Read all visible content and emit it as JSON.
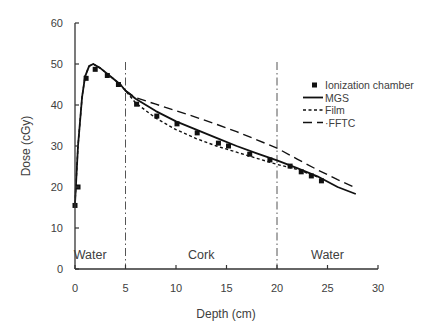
{
  "chart_data": {
    "type": "line",
    "title": "",
    "xlabel": "Depth (cm)",
    "ylabel": "Dose (cGy)",
    "xlim": [
      0,
      30
    ],
    "ylim": [
      0,
      60
    ],
    "xticks": [
      0,
      5,
      10,
      15,
      20,
      25,
      30
    ],
    "yticks": [
      0,
      10,
      20,
      30,
      40,
      50,
      60
    ],
    "grid": false,
    "legend_position": "right-center",
    "region_boundaries": [
      5,
      20
    ],
    "region_labels": [
      {
        "text": "Water",
        "x": 1.5
      },
      {
        "text": "Cork",
        "x": 12.5
      },
      {
        "text": "Water",
        "x": 25
      }
    ],
    "series": [
      {
        "name": "Ionization chamber",
        "style": "markers",
        "marker": "square",
        "x": [
          0,
          0.3,
          1.1,
          2.0,
          3.2,
          4.3,
          6.1,
          8.1,
          10.1,
          12.1,
          14.2,
          15.2,
          17.3,
          19.3,
          21.3,
          22.4,
          23.4,
          24.4
        ],
        "y": [
          15.5,
          20,
          46.5,
          48.7,
          47.2,
          45.0,
          40.2,
          37.3,
          35.4,
          33.2,
          30.7,
          30.0,
          28.0,
          26.6,
          25.1,
          23.7,
          22.7,
          21.5
        ]
      },
      {
        "name": "MGS",
        "style": "solid",
        "x": [
          0,
          0.3,
          0.7,
          1.0,
          1.4,
          1.8,
          2.5,
          3.5,
          4.5,
          5.0,
          6.0,
          8.0,
          10.0,
          12.0,
          14.0,
          16.0,
          18.0,
          20.0,
          22.0,
          24.0,
          26.0,
          27.8
        ],
        "y": [
          16,
          30,
          42,
          47,
          49.5,
          50,
          49,
          47,
          45,
          43.5,
          41.5,
          38.5,
          36,
          34,
          32,
          30,
          28.2,
          26.5,
          24.6,
          22.6,
          20.0,
          18.3
        ]
      },
      {
        "name": "Film",
        "style": "dashed-short",
        "x": [
          0,
          0.3,
          0.7,
          1.0,
          1.4,
          1.8,
          2.5,
          3.5,
          4.5,
          5.0,
          6.0,
          8.0,
          10.0,
          12.0,
          14.0,
          16.0,
          18.0,
          20.0,
          22.0,
          24.0
        ],
        "y": [
          16,
          30,
          42,
          47,
          49.5,
          50,
          49,
          47,
          45,
          43.5,
          40.5,
          36.8,
          34,
          31.8,
          30,
          28.5,
          27,
          25.5,
          24.3,
          22.5
        ]
      },
      {
        "name": "FFTC",
        "style": "dashed-long",
        "x": [
          5.0,
          6.0,
          8.0,
          10.0,
          12.0,
          14.0,
          16.0,
          18.0,
          20.0,
          22.0,
          24.0,
          26.0,
          27.8
        ],
        "y": [
          43.5,
          41.8,
          40.2,
          38.6,
          37.0,
          35.3,
          33.5,
          31.5,
          29.5,
          26.8,
          24.2,
          21.8,
          19.8
        ]
      }
    ]
  }
}
